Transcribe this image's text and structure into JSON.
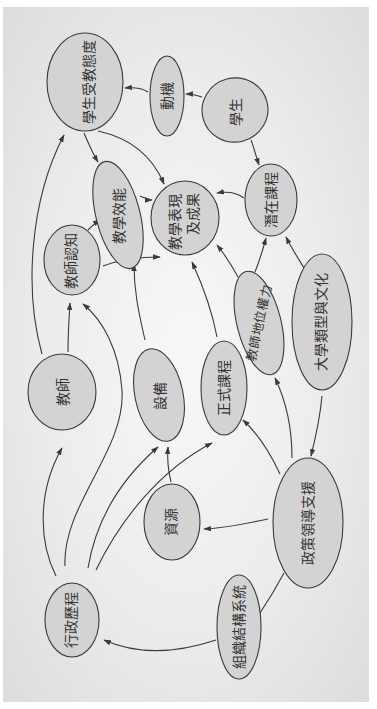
{
  "diagram": {
    "orientation": "rotated-90-ccw",
    "colors": {
      "background": "#ececec",
      "node_fill": "#d3d3d3",
      "node_stroke": "#3a3a3a",
      "text": "#333333"
    },
    "nodes": {
      "student_attitude": {
        "label": "學生受教態度"
      },
      "motivation": {
        "label": "動機"
      },
      "student": {
        "label": "學生"
      },
      "teaching_efficacy": {
        "label": "教學效能"
      },
      "teaching_outcomes_l1": {
        "label": "教學表現"
      },
      "teaching_outcomes_l2": {
        "label": "及成果"
      },
      "hidden_curriculum": {
        "label": "潛在課程"
      },
      "teacher_cognition": {
        "label": "教師認知"
      },
      "teacher_status_power": {
        "label": "教師地位權力"
      },
      "university_type_culture": {
        "label": "大學類型與文化"
      },
      "teacher": {
        "label": "教師"
      },
      "equipment": {
        "label": "設備"
      },
      "formal_curriculum": {
        "label": "正式課程"
      },
      "resources": {
        "label": "資源"
      },
      "policy_leadership_support": {
        "label": "政策領導支援"
      },
      "administrative_process": {
        "label": "行政歷程"
      },
      "organizational_structure": {
        "label": "組織結構系統"
      }
    },
    "edges": [
      {
        "from": "motivation",
        "to": "student_attitude"
      },
      {
        "from": "student",
        "to": "motivation"
      },
      {
        "from": "student",
        "to": "hidden_curriculum"
      },
      {
        "from": "student_attitude",
        "to": "teaching_efficacy"
      },
      {
        "from": "student_attitude",
        "to": "teaching_outcomes"
      },
      {
        "from": "teaching_efficacy",
        "to": "teaching_outcomes"
      },
      {
        "from": "hidden_curriculum",
        "to": "teaching_outcomes"
      },
      {
        "from": "teacher_cognition",
        "to": "teaching_efficacy"
      },
      {
        "from": "teacher_cognition",
        "to": "teaching_outcomes"
      },
      {
        "from": "teacher",
        "to": "teacher_cognition"
      },
      {
        "from": "teacher",
        "to": "student_attitude"
      },
      {
        "from": "equipment",
        "to": "teaching_outcomes"
      },
      {
        "from": "formal_curriculum",
        "to": "teaching_outcomes"
      },
      {
        "from": "teacher_status_power",
        "to": "teaching_outcomes"
      },
      {
        "from": "teacher_status_power",
        "to": "hidden_curriculum"
      },
      {
        "from": "university_type_culture",
        "to": "hidden_curriculum"
      },
      {
        "from": "university_type_culture",
        "to": "policy_leadership_support"
      },
      {
        "from": "policy_leadership_support",
        "to": "teacher_status_power"
      },
      {
        "from": "policy_leadership_support",
        "to": "formal_curriculum"
      },
      {
        "from": "policy_leadership_support",
        "to": "resources"
      },
      {
        "from": "resources",
        "to": "equipment"
      },
      {
        "from": "administrative_process",
        "to": "teacher"
      },
      {
        "from": "administrative_process",
        "to": "teacher_cognition"
      },
      {
        "from": "administrative_process",
        "to": "equipment"
      },
      {
        "from": "administrative_process",
        "to": "formal_curriculum"
      },
      {
        "from": "organizational_structure",
        "to": "administrative_process"
      },
      {
        "from": "organizational_structure",
        "to": "policy_leadership_support"
      }
    ]
  }
}
